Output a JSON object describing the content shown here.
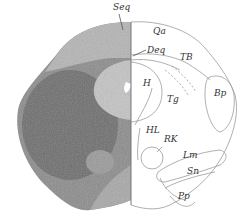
{
  "figure": {
    "labels": [
      {
        "id": "seq",
        "text": "Seq",
        "x": 113,
        "y": 3
      },
      {
        "id": "qa",
        "text": "Qa",
        "x": 153,
        "y": 27
      },
      {
        "id": "deq",
        "text": "Deq",
        "x": 147,
        "y": 46
      },
      {
        "id": "tb",
        "text": "TB",
        "x": 180,
        "y": 53
      },
      {
        "id": "h",
        "text": "H",
        "x": 143,
        "y": 79
      },
      {
        "id": "tg",
        "text": "Tg",
        "x": 167,
        "y": 95
      },
      {
        "id": "bp",
        "text": "Bp",
        "x": 214,
        "y": 89
      },
      {
        "id": "hl",
        "text": "HL",
        "x": 146,
        "y": 126
      },
      {
        "id": "rk",
        "text": "RK",
        "x": 164,
        "y": 135
      },
      {
        "id": "lm",
        "text": "Lm",
        "x": 183,
        "y": 151
      },
      {
        "id": "sn",
        "text": "Sn",
        "x": 187,
        "y": 167
      },
      {
        "id": "pp",
        "text": "Pp",
        "x": 178,
        "y": 192
      }
    ]
  }
}
